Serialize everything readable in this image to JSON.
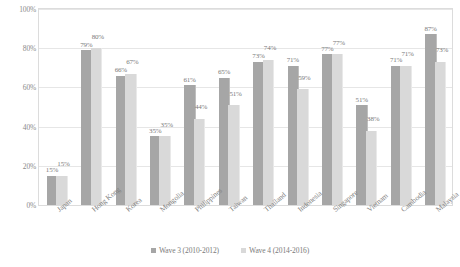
{
  "chart_data": {
    "type": "bar",
    "title": "",
    "subtitle": "",
    "xlabel": "",
    "ylabel": "",
    "ylim": [
      0,
      100
    ],
    "yticks": [
      "0%",
      "20%",
      "40%",
      "60%",
      "80%",
      "100%"
    ],
    "ytick_values": [
      0,
      20,
      40,
      60,
      80,
      100
    ],
    "grid": true,
    "legend_position": "bottom",
    "categories": [
      "Japan",
      "Hong Kong",
      "Korea",
      "Mongolia",
      "Philippines",
      "Taiwan",
      "Thailand",
      "Indonesia",
      "Singapore",
      "Vietnam",
      "Cambodia",
      "Malaysia"
    ],
    "series": [
      {
        "name": "Wave 3 (2010-2012)",
        "color": "#a6a6a6",
        "values": [
          15,
          79,
          66,
          35,
          61,
          65,
          73,
          71,
          77,
          51,
          71,
          87
        ],
        "labels": [
          "15%",
          "79%",
          "66%",
          "35%",
          "61%",
          "65%",
          "73%",
          "71%",
          "77%",
          "51%",
          "71%",
          "87%"
        ]
      },
      {
        "name": "Wave 4 (2014-2016)",
        "color": "#d9d9d9",
        "values": [
          15,
          80,
          67,
          35,
          44,
          51,
          74,
          59,
          77,
          38,
          71,
          73
        ],
        "labels": [
          "15%",
          "80%",
          "67%",
          "35%",
          "44%",
          "51%",
          "74%",
          "59%",
          "77%",
          "38%",
          "71%",
          "73%"
        ]
      }
    ]
  },
  "legend": {
    "items": [
      {
        "label": "Wave 3 (2010-2012)",
        "color": "#a6a6a6"
      },
      {
        "label": "Wave 4 (2014-2016)",
        "color": "#d9d9d9"
      }
    ]
  }
}
